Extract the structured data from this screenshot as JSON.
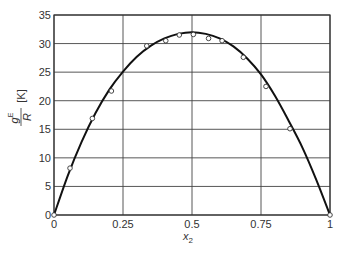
{
  "chart_data": {
    "type": "scatter",
    "title": "",
    "xlabel": "x2",
    "ylabel": "gE/R [K]",
    "xlim": [
      0,
      1
    ],
    "ylim": [
      0,
      35
    ],
    "grid": true,
    "xticks": [
      "0",
      "0.25",
      "0.5",
      "0.75",
      "1"
    ],
    "yticks": [
      "0",
      "5",
      "10",
      "15",
      "20",
      "25",
      "30",
      "35"
    ],
    "series": [
      {
        "name": "experimental",
        "style": "open-circle",
        "x": [
          0,
          0.058,
          0.139,
          0.208,
          0.336,
          0.405,
          0.454,
          0.505,
          0.56,
          0.609,
          0.686,
          0.768,
          0.855,
          1.0
        ],
        "y": [
          0,
          8.2,
          16.9,
          21.7,
          29.6,
          30.5,
          31.5,
          31.6,
          30.9,
          30.5,
          27.6,
          22.5,
          15.1,
          0
        ]
      },
      {
        "name": "model fit",
        "style": "line",
        "x": [
          0,
          0.05,
          0.1,
          0.15,
          0.2,
          0.25,
          0.3,
          0.35,
          0.4,
          0.45,
          0.5,
          0.55,
          0.6,
          0.65,
          0.7,
          0.75,
          0.8,
          0.85,
          0.9,
          0.95,
          1.0
        ],
        "y": [
          0,
          6.9,
          12.8,
          17.8,
          21.9,
          25.1,
          27.7,
          29.6,
          30.9,
          31.7,
          32.0,
          31.7,
          30.9,
          29.5,
          27.4,
          24.6,
          20.9,
          16.5,
          11.8,
          6.2,
          0
        ]
      }
    ],
    "axis_labels": {
      "x_main": "x",
      "x_sub": "2",
      "y_num": "g",
      "y_sup": "E",
      "y_den": "R",
      "y_unit": "[K]"
    }
  }
}
